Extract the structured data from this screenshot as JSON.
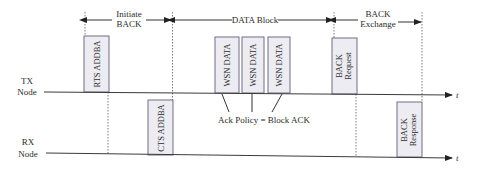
{
  "phases": [
    {
      "line1": "Initiate",
      "line2": "BACK"
    },
    {
      "line1": "DATA Block"
    },
    {
      "line1": "BACK",
      "line2": "Exchange"
    }
  ],
  "nodes": {
    "tx": {
      "line1": "TX",
      "line2": "Node"
    },
    "rx": {
      "line1": "RX",
      "line2": "Node"
    }
  },
  "time_label": "t",
  "frames": {
    "rts": "RTS ADDBA",
    "cts": "CTS ADDBA",
    "wsn": [
      "WSN DATA",
      "WSN DATA",
      "WSN DATA"
    ],
    "back_request": {
      "line1": "BACK",
      "line2": "Request"
    },
    "back_response": {
      "line1": "BACK",
      "line2": "Response"
    }
  },
  "annotation": "Ack Policy = Block ACK",
  "colors": {
    "frame_fill": "#ececf2",
    "frame_border": "#6f6f84"
  }
}
